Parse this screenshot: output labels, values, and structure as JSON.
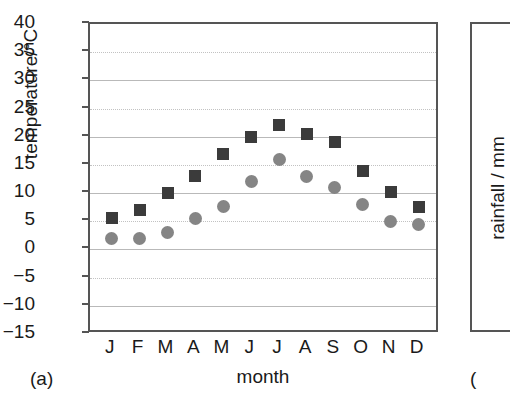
{
  "panel": {
    "label_a": "(a)",
    "label_b": "("
  },
  "neighbour_panel": {
    "ylabel": "rainfall / mm"
  },
  "chart_data": {
    "type": "scatter",
    "title": "",
    "xlabel": "month",
    "ylabel": "temperature/°C",
    "categories": [
      "J",
      "F",
      "M",
      "A",
      "M",
      "J",
      "J",
      "A",
      "S",
      "O",
      "N",
      "D"
    ],
    "ytick_labels": [
      "40",
      "35",
      "30",
      "25",
      "20",
      "15",
      "10",
      "5",
      "0",
      "−5",
      "−10",
      "−15"
    ],
    "yticks": [
      40,
      35,
      30,
      25,
      20,
      15,
      10,
      5,
      0,
      -5,
      -10,
      -15
    ],
    "ylim": [
      -15,
      40
    ],
    "grid": true,
    "legend_position": "none",
    "series": [
      {
        "name": "maximum temperature",
        "marker": "square",
        "color": "#3b3b3b",
        "values": [
          5.5,
          7.0,
          10.0,
          13.0,
          17.0,
          20.0,
          22.0,
          20.5,
          19.0,
          14.0,
          10.2,
          7.5
        ]
      },
      {
        "name": "minimum temperature",
        "marker": "circle",
        "color": "#858585",
        "values": [
          2.0,
          2.0,
          3.0,
          5.5,
          7.7,
          12.0,
          16.0,
          13.0,
          11.0,
          8.0,
          5.0,
          4.5
        ]
      }
    ]
  }
}
